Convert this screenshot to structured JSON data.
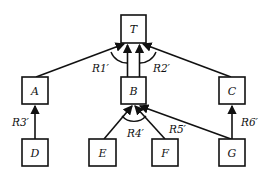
{
  "diagram": {
    "type": "and-or tree",
    "nodes": [
      {
        "id": "T",
        "label": "T"
      },
      {
        "id": "A",
        "label": "A"
      },
      {
        "id": "B",
        "label": "B"
      },
      {
        "id": "C",
        "label": "C"
      },
      {
        "id": "D",
        "label": "D"
      },
      {
        "id": "E",
        "label": "E"
      },
      {
        "id": "F",
        "label": "F"
      },
      {
        "id": "G",
        "label": "G"
      }
    ],
    "rules": [
      {
        "label": "R1′",
        "from": [
          "A",
          "B"
        ],
        "to": "T",
        "conjunctive": true
      },
      {
        "label": "R2′",
        "from": [
          "B",
          "C"
        ],
        "to": "T",
        "conjunctive": true
      },
      {
        "label": "R3′",
        "from": [
          "D"
        ],
        "to": "A",
        "conjunctive": false
      },
      {
        "label": "R4′",
        "from": [
          "E",
          "F"
        ],
        "to": "B",
        "conjunctive": true
      },
      {
        "label": "R5′",
        "from": [
          "G"
        ],
        "to": "B",
        "conjunctive": false
      },
      {
        "label": "R6′",
        "from": [
          "G"
        ],
        "to": "C",
        "conjunctive": false
      }
    ]
  },
  "labels": {
    "T": "T",
    "A": "A",
    "B": "B",
    "C": "C",
    "D": "D",
    "E": "E",
    "F": "F",
    "G": "G",
    "R1": "R1′",
    "R2": "R2′",
    "R3": "R3′",
    "R4": "R4′",
    "R5": "R5′",
    "R6": "R6′"
  }
}
